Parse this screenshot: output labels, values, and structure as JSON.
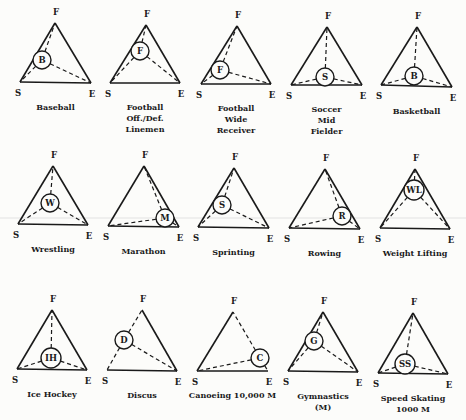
{
  "figure": {
    "vertex_labels": {
      "top": "F",
      "left": "S",
      "right": "E"
    },
    "panels": [
      {
        "id": "baseball",
        "title_lines": [
          "Baseball"
        ],
        "marker": "B",
        "F": [
          55,
          23
        ],
        "S": [
          20,
          82
        ],
        "E": [
          91,
          83
        ],
        "c": [
          42,
          60
        ],
        "r": 9,
        "dashedEdges": [
          "FS"
        ]
      },
      {
        "id": "football-linemen",
        "title_lines": [
          "Football",
          "Off./Def.",
          "Linemen"
        ],
        "marker": "F",
        "F": [
          146,
          25
        ],
        "S": [
          110,
          83
        ],
        "E": [
          180,
          83
        ],
        "c": [
          140,
          51
        ],
        "r": 9,
        "dashedEdges": []
      },
      {
        "id": "football-receiver",
        "title_lines": [
          "Football",
          "Wide",
          "Receiver"
        ],
        "marker": "F",
        "F": [
          237,
          26
        ],
        "S": [
          201,
          84
        ],
        "E": [
          271,
          84
        ],
        "c": [
          220,
          70
        ],
        "r": 9,
        "dashedEdges": []
      },
      {
        "id": "soccer-midfielder",
        "title_lines": [
          "Soccer",
          "Mid",
          "Fielder"
        ],
        "marker": "S",
        "F": [
          327,
          27
        ],
        "S": [
          291,
          85
        ],
        "E": [
          362,
          85
        ],
        "c": [
          325,
          77
        ],
        "r": 9,
        "dashedEdges": []
      },
      {
        "id": "basketball",
        "title_lines": [
          "Basketball"
        ],
        "marker": "B",
        "F": [
          417,
          27
        ],
        "S": [
          381,
          85
        ],
        "E": [
          452,
          87
        ],
        "c": [
          414,
          76
        ],
        "r": 9,
        "dashedEdges": []
      },
      {
        "id": "wrestling",
        "title_lines": [
          "Wrestling"
        ],
        "marker": "W",
        "F": [
          53,
          166
        ],
        "S": [
          18,
          224
        ],
        "E": [
          88,
          225
        ],
        "c": [
          50,
          203
        ],
        "r": 9,
        "dashedEdges": []
      },
      {
        "id": "marathon",
        "title_lines": [
          "Marathon"
        ],
        "marker": "M",
        "F": [
          144,
          166
        ],
        "S": [
          108,
          226
        ],
        "E": [
          179,
          227
        ],
        "c": [
          165,
          218
        ],
        "r": 9,
        "dashedEdges": []
      },
      {
        "id": "sprinting",
        "title_lines": [
          "Sprinting"
        ],
        "marker": "S",
        "F": [
          234,
          168
        ],
        "S": [
          198,
          227
        ],
        "E": [
          269,
          228
        ],
        "c": [
          222,
          205
        ],
        "r": 9,
        "dashedEdges": []
      },
      {
        "id": "rowing",
        "title_lines": [
          "Rowing"
        ],
        "marker": "R",
        "F": [
          325,
          169
        ],
        "S": [
          289,
          228
        ],
        "E": [
          360,
          229
        ],
        "c": [
          342,
          216
        ],
        "r": 9,
        "dashedEdges": []
      },
      {
        "id": "weight-lifting",
        "title_lines": [
          "Weight Lifting"
        ],
        "marker": "WL",
        "F": [
          415,
          169
        ],
        "S": [
          380,
          228
        ],
        "E": [
          450,
          229
        ],
        "c": [
          414,
          190
        ],
        "r": 10,
        "dashedEdges": []
      },
      {
        "id": "ice-hockey",
        "title_lines": [
          "Ice Hockey"
        ],
        "marker": "IH",
        "F": [
          52,
          310
        ],
        "S": [
          17,
          369
        ],
        "E": [
          87,
          370
        ],
        "c": [
          51,
          358
        ],
        "r": 10,
        "dashedEdges": []
      },
      {
        "id": "discus",
        "title_lines": [
          "Discus"
        ],
        "marker": "D",
        "F": [
          142,
          310
        ],
        "S": [
          107,
          370
        ],
        "E": [
          177,
          371
        ],
        "c": [
          124,
          340
        ],
        "r": 9,
        "dashedEdges": [],
        "missingEdges": [
          "FS"
        ]
      },
      {
        "id": "canoeing",
        "title_lines": [
          "Canoeing 10,000 M"
        ],
        "marker": "C",
        "F": [
          233,
          312
        ],
        "S": [
          197,
          371
        ],
        "E": [
          268,
          371
        ],
        "c": [
          260,
          358
        ],
        "r": 9,
        "dashedEdges": [],
        "missingEdges": [
          "FE"
        ]
      },
      {
        "id": "gymnastics",
        "title_lines": [
          "Gymnastics",
          "(M)"
        ],
        "marker": "G",
        "F": [
          323,
          312
        ],
        "S": [
          288,
          371
        ],
        "E": [
          358,
          372
        ],
        "c": [
          314,
          341
        ],
        "r": 9,
        "dashedEdges": []
      },
      {
        "id": "speed-skating",
        "title_lines": [
          "Speed Skating",
          "1000 M"
        ],
        "marker": "SS",
        "F": [
          413,
          313
        ],
        "S": [
          378,
          373
        ],
        "E": [
          448,
          374
        ],
        "c": [
          405,
          364
        ],
        "r": 10,
        "dashedEdges": []
      }
    ]
  }
}
